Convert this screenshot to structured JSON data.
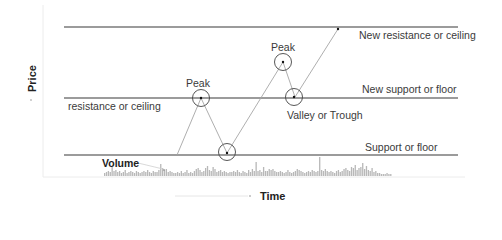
{
  "axes": {
    "y_label": "Price",
    "x_label": "Time"
  },
  "volume_label": "Volume",
  "levels": [
    {
      "id": "new-resistance",
      "label": "New resistance or ceiling",
      "y": 27
    },
    {
      "id": "new-support",
      "label": "New support or  floor",
      "y": 98
    },
    {
      "id": "old-resistance",
      "label": "resistance or ceiling",
      "y": 98
    },
    {
      "id": "support",
      "label": "Support or floor",
      "y": 155
    }
  ],
  "annotations": {
    "peak1": "Peak",
    "peak2": "Peak",
    "valley": "Valley or Trough"
  },
  "colors": {
    "level_line": "#7a7a7a",
    "price_path": "#9a9a9a",
    "circle": "#444444",
    "volume_bar": "#b8b8b8",
    "axis": "#e2e2e2"
  },
  "chart_data": {
    "type": "line",
    "title": "",
    "xlabel": "Time",
    "ylabel": "Price",
    "grid": false,
    "horizontal_levels": [
      {
        "name": "New resistance or ceiling",
        "level": 3
      },
      {
        "name": "New support or floor (former resistance or ceiling)",
        "level": 2
      },
      {
        "name": "Support or floor",
        "level": 1
      }
    ],
    "series": [
      {
        "name": "Price",
        "x": [
          0,
          1,
          2,
          3,
          4,
          5
        ],
        "values": [
          1.0,
          2.0,
          1.0,
          2.6,
          2.0,
          3.0
        ],
        "point_labels": [
          "",
          "Peak",
          "Valley at support",
          "Peak",
          "Valley or Trough",
          ""
        ]
      }
    ],
    "volume": {
      "label": "Volume",
      "bars": [
        3,
        4,
        5,
        4,
        9,
        5,
        6,
        4,
        5,
        3,
        4,
        6,
        3,
        4,
        5,
        4,
        3,
        5,
        4,
        3,
        4,
        5,
        4,
        6,
        4,
        3,
        5,
        4,
        4,
        6,
        12,
        8,
        6,
        7,
        4,
        5,
        4,
        3,
        3,
        4,
        3,
        5,
        3,
        4,
        6,
        3,
        4,
        3,
        5,
        7,
        8,
        6,
        4,
        5,
        8,
        10,
        6,
        5,
        9,
        7,
        4,
        5,
        6,
        4,
        5,
        4,
        3,
        4,
        4,
        5,
        4,
        6,
        4,
        3,
        5,
        4,
        3,
        6,
        4,
        7,
        5,
        14,
        5,
        6,
        4,
        9,
        5,
        5,
        7,
        6,
        7,
        5,
        4,
        4,
        5,
        4,
        3,
        4,
        6,
        4,
        3,
        4,
        5,
        7,
        6,
        5,
        4,
        3,
        4,
        5,
        4,
        6,
        5,
        4,
        5,
        19,
        6,
        5,
        7,
        5,
        4,
        5,
        4,
        3,
        5,
        6,
        4,
        5,
        7,
        8,
        6,
        5,
        9,
        8,
        11,
        6,
        8,
        9,
        13,
        7,
        10,
        6,
        5,
        8,
        4,
        5,
        3,
        3,
        2,
        2,
        2,
        3,
        2,
        2
      ]
    }
  }
}
